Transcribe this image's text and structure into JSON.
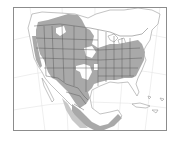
{
  "map": {
    "type": "species range map",
    "region": "North America",
    "projection": "conic",
    "frame": {
      "x": 13,
      "y": 7,
      "width": 154,
      "height": 124
    },
    "colors": {
      "background": "#ffffff",
      "range_fill": "#a9a9a9",
      "range_fill_light": "#c4c4c4",
      "borders": "#555555",
      "coast": "#9a9a9a",
      "graticule": "#dcdcdc",
      "frame": "#8c8c8c"
    },
    "legend": []
  }
}
